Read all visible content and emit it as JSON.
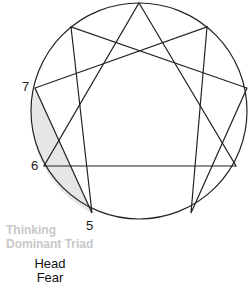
{
  "diagram": {
    "type": "enneagram",
    "shaded_region": "points 5-6-7 (head center)",
    "shade_color": "#e6e6e6",
    "line_color": "#222222",
    "labels": {
      "seven": "7",
      "six": "6",
      "five": "5"
    },
    "triad": {
      "line1": "Thinking",
      "line2": "Dominant Triad"
    },
    "center": {
      "name": "Head",
      "emotion": "Fear"
    }
  }
}
